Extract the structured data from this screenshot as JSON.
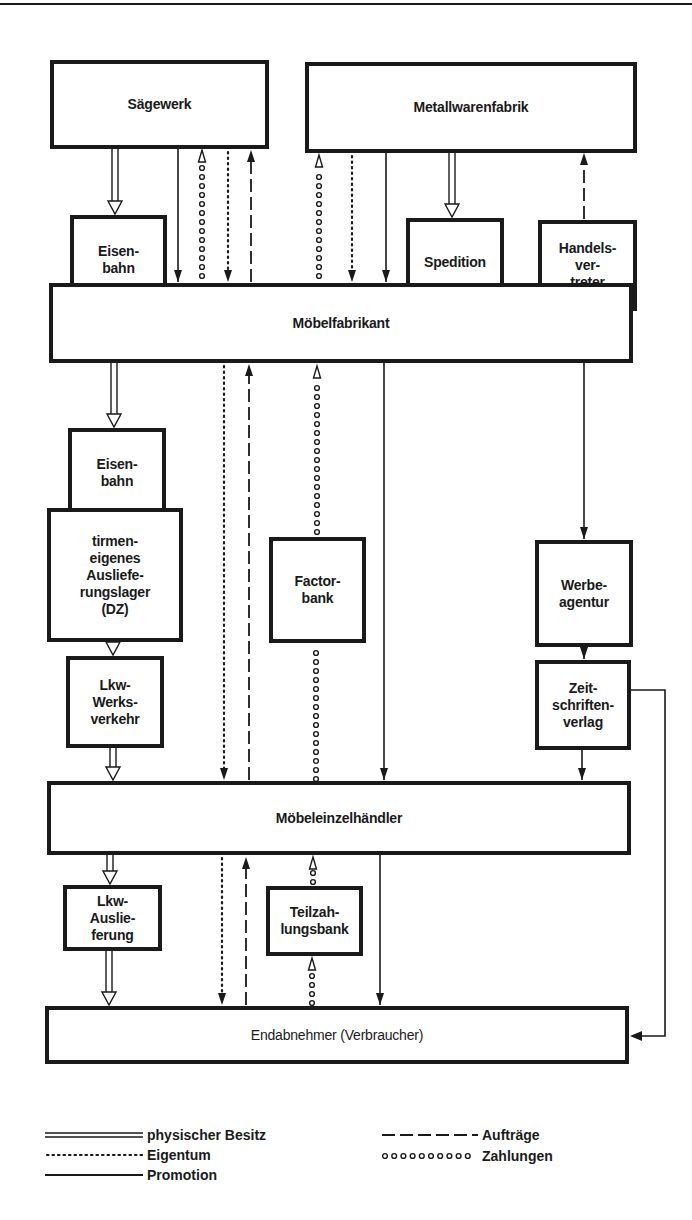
{
  "nodes": {
    "saegewerk": "Sägewerk",
    "metallwarenfabrik": "Metallwarenfabrik",
    "eisenbahn_1": "Eisen-\nbahn",
    "spedition": "Spedition",
    "handelsvertreter": "Handels-\nver-\ntreter",
    "moebelfabrikant": "Möbelfabrikant",
    "eisenbahn_2": "Eisen-\nbahn",
    "auslieferungslager": "tirmen-\neigenes\nAusliefe-\nrungslager\n(DZ)",
    "factorbank": "Factor-\nbank",
    "werbeagentur": "Werbe-\nagentur",
    "lkw_werksverkehr": "Lkw-\nWerks-\nverkehr",
    "zeitschriftenverlag": "Zeit-\nschriften-\nverlag",
    "moebeleinzelhaendler": "Möbeleinzelhändler",
    "lkw_auslieferung": "Lkw-\nAuslie-\nferung",
    "teilzahlungsbank": "Teilzah-\nlungsbank",
    "endabnehmer": "Endabnehmer (Verbraucher)"
  },
  "flows": {
    "physical": "physischer Besitz",
    "ownership": "Eigentum",
    "promotion": "Promotion",
    "orders": "Aufträge",
    "payments": "Zahlungen"
  },
  "legend": [
    {
      "key": "physical",
      "label": "physischer Besitz"
    },
    {
      "key": "ownership",
      "label": "Eigentum"
    },
    {
      "key": "promotion",
      "label": "Promotion"
    },
    {
      "key": "orders",
      "label": "Aufträge"
    },
    {
      "key": "payments",
      "label": "Zahlungen"
    }
  ],
  "colors": {
    "ink": "#1a1a1a",
    "paper": "#ffffff"
  }
}
